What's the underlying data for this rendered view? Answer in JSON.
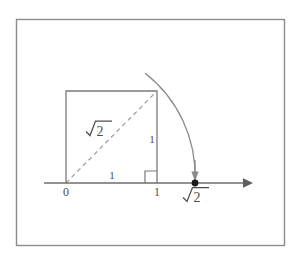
{
  "figure": {
    "background_color": "#ffffff",
    "frame": {
      "name": "outer-border",
      "color": "#8c8c8c",
      "x": 16,
      "y": 19,
      "width": 269,
      "height": 227
    },
    "colors": {
      "line": "#7a7a7a",
      "axis": "#6e6e6e",
      "dashed": "#9a9a9a",
      "arc": "#8a8a8a",
      "text": "#4d4d4d",
      "dot": "#1a1a1a"
    },
    "axis": {
      "name": "number-line",
      "y": 183,
      "x_start": 44,
      "x_end": 253,
      "arrow_label": "right-arrow"
    },
    "square": {
      "name": "unit-square",
      "left": 66,
      "right": 157,
      "top": 91,
      "bottom": 183,
      "side_length": 1
    },
    "diagonal": {
      "name": "square-diagonal",
      "from": [
        66,
        183
      ],
      "to": [
        157,
        91
      ],
      "style": "dashed",
      "length_label": "√2"
    },
    "arc": {
      "name": "compass-arc",
      "center": [
        66,
        183
      ],
      "radius": 130,
      "start": [
        146,
        74
      ],
      "end": [
        195,
        180
      ],
      "description": "arc swinging the diagonal length down onto the number line"
    },
    "right_angle_mark": {
      "name": "right-angle-marker",
      "x": 145,
      "y": 171,
      "size": 12
    },
    "point_marker": {
      "name": "sqrt2-point",
      "x": 195,
      "y": 183,
      "radius": 3.4
    },
    "arrow_down": {
      "name": "arc-end-arrowhead",
      "x": 195,
      "y_top": 160,
      "y_tip": 181
    },
    "labels": [
      {
        "id": "origin",
        "name": "label-origin-zero",
        "text": "0",
        "x": 66,
        "y": 196,
        "font_size": 12,
        "anchor": "middle"
      },
      {
        "id": "one_x",
        "name": "label-one-on-axis",
        "text": "1",
        "x": 157,
        "y": 196,
        "font_size": 12,
        "anchor": "middle"
      },
      {
        "id": "base_unit",
        "name": "label-base-side-one",
        "text": "1",
        "x": 112,
        "y": 179,
        "font_size": 11,
        "anchor": "middle"
      },
      {
        "id": "height_unit",
        "name": "label-vertical-side-one",
        "text": "1",
        "x": 152,
        "y": 143,
        "font_size": 11,
        "anchor": "middle"
      }
    ],
    "radicals": [
      {
        "id": "diagonal_radical",
        "name": "label-diagonal-sqrt2",
        "text": "√2",
        "radicand": "2",
        "x": 86,
        "y": 136,
        "font_size": 15,
        "rotation": 0
      },
      {
        "id": "axis_radical",
        "name": "label-axis-sqrt2",
        "text": "√2",
        "radicand": "2",
        "x": 183,
        "y": 202,
        "font_size": 15,
        "rotation": 0
      }
    ]
  }
}
